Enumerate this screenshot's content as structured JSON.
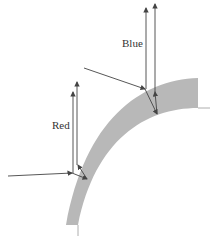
{
  "labels": {
    "blue": "Blue",
    "red": "Red"
  },
  "colors": {
    "band_fill": "#b8b8b8",
    "ray_stroke": "#444444",
    "edge_stroke": "#999999"
  }
}
